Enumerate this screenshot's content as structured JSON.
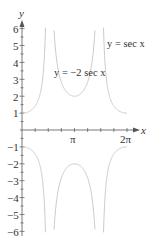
{
  "chart_data": {
    "type": "line",
    "title": "",
    "xlabel": "x",
    "ylabel": "y",
    "xlim": [
      0,
      6.2832
    ],
    "ylim": [
      -6,
      6
    ],
    "grid": false,
    "x_ticks": [
      {
        "value": 3.1416,
        "label": "π"
      },
      {
        "value": 6.2832,
        "label": "2π"
      }
    ],
    "y_ticks": [
      {
        "value": 6,
        "label": "6"
      },
      {
        "value": 5,
        "label": "5"
      },
      {
        "value": 4,
        "label": "4"
      },
      {
        "value": 3,
        "label": "3"
      },
      {
        "value": 2,
        "label": "2"
      },
      {
        "value": 1,
        "label": "1"
      },
      {
        "value": -1,
        "label": "−1"
      },
      {
        "value": -2,
        "label": "−2"
      },
      {
        "value": -3,
        "label": "−3"
      },
      {
        "value": -4,
        "label": "−4"
      },
      {
        "value": -5,
        "label": "−5"
      },
      {
        "value": -6,
        "label": "−6"
      }
    ],
    "vertical_asymptotes": [
      1.5708,
      4.7124
    ],
    "series": [
      {
        "name": "y = sec x",
        "description": "branches starting at 1 at x=0 and x=2π, lower middle branch",
        "key_points": [
          [
            0,
            1
          ],
          [
            6.2832,
            1
          ],
          [
            3.1416,
            -1
          ]
        ]
      },
      {
        "name": "y = −2 sec x",
        "description": "upper middle branch min at (π, 2), lower outer branches",
        "key_points": [
          [
            3.1416,
            2
          ],
          [
            0,
            -2
          ],
          [
            6.2832,
            -2
          ]
        ]
      }
    ],
    "annotations": [
      {
        "text": "y = sec x",
        "position": "upper right"
      },
      {
        "text": "y = −2 sec x",
        "position": "center left of upper middle branch"
      }
    ],
    "colors": {
      "curve": "#c8c8c8",
      "axis": "#555555",
      "text": "#333333"
    }
  },
  "labels": {
    "x_axis": "x",
    "y_axis": "y",
    "curve1": "y = sec x",
    "curve2": "y = −2 sec x",
    "pi": "π",
    "two_pi": "2π",
    "y6": "6",
    "y5": "5",
    "y4": "4",
    "y3": "3",
    "y2": "2",
    "y1": "1",
    "yn1": "−1",
    "yn2": "−2",
    "yn3": "−3",
    "yn4": "−4",
    "yn5": "−5",
    "yn6": "−6"
  }
}
